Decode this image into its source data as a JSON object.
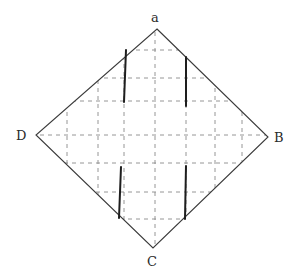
{
  "diagram": {
    "type": "folding-pattern-diamond",
    "vertices": {
      "top": {
        "label": "a",
        "x": 157,
        "y": 29,
        "label_x": 151,
        "label_y": 22
      },
      "right": {
        "label": "B",
        "x": 268,
        "y": 137,
        "label_x": 274,
        "label_y": 142
      },
      "bottom": {
        "label": "C",
        "x": 153,
        "y": 248,
        "label_x": 147,
        "label_y": 266
      },
      "left": {
        "label": "D",
        "x": 36,
        "y": 135,
        "label_x": 16,
        "label_y": 140
      }
    },
    "grid": {
      "style": "dashed",
      "vertical_x": [
        67,
        98,
        124,
        155,
        186,
        215,
        242
      ],
      "horizontal_y": [
        50,
        78,
        101,
        135,
        163,
        192,
        219
      ]
    },
    "solid_lines": [
      {
        "name": "upper-left-cut",
        "x1": 126,
        "y1": 50,
        "x2": 124,
        "y2": 102
      },
      {
        "name": "upper-right-cut",
        "x1": 186,
        "y1": 57,
        "x2": 186,
        "y2": 106
      },
      {
        "name": "lower-left-cut",
        "x1": 121,
        "y1": 167,
        "x2": 119,
        "y2": 218
      },
      {
        "name": "lower-right-cut",
        "x1": 186,
        "y1": 166,
        "x2": 185,
        "y2": 219
      }
    ],
    "colors": {
      "outline": "#3a3a3a",
      "grid": "#8a8a8a",
      "cut": "#1e1e1e",
      "background": "#ffffff"
    }
  }
}
